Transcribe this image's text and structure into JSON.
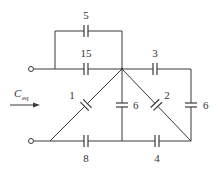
{
  "diagram": {
    "type": "capacitor network",
    "input_label": "C",
    "input_label_sub": "eq",
    "capacitors": [
      {
        "id": "c5",
        "value": "5",
        "position": "top parallel branch"
      },
      {
        "id": "c15",
        "value": "15",
        "position": "top input line"
      },
      {
        "id": "c3",
        "value": "3",
        "position": "top right"
      },
      {
        "id": "c1",
        "value": "1",
        "position": "left diagonal"
      },
      {
        "id": "c6_mid",
        "value": "6",
        "position": "center vertical"
      },
      {
        "id": "c2",
        "value": "2",
        "position": "right diagonal"
      },
      {
        "id": "c6_right",
        "value": "6",
        "position": "right vertical"
      },
      {
        "id": "c8",
        "value": "8",
        "position": "bottom left"
      },
      {
        "id": "c4",
        "value": "4",
        "position": "bottom right"
      }
    ]
  }
}
